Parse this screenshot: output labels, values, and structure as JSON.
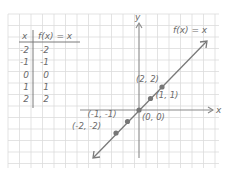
{
  "table": {
    "header": {
      "x": "x",
      "fx": "f(x) = x"
    },
    "rows": [
      {
        "x": "-2",
        "fx": "-2"
      },
      {
        "x": "-1",
        "fx": "-1"
      },
      {
        "x": "0",
        "fx": "0"
      },
      {
        "x": "1",
        "fx": "1"
      },
      {
        "x": "2",
        "fx": "2"
      }
    ]
  },
  "graph": {
    "x_axis_label": "x",
    "y_axis_label": "y",
    "function_label": "f(x) = x",
    "points": [
      {
        "label": "(-2, -2)",
        "x": -2,
        "y": -2
      },
      {
        "label": "(-1, -1)",
        "x": -1,
        "y": -1
      },
      {
        "label": "(0, 0)",
        "x": 0,
        "y": 0
      },
      {
        "label": "(1, 1)",
        "x": 1,
        "y": 1
      },
      {
        "label": "(2, 2)",
        "x": 2,
        "y": 2
      }
    ]
  },
  "colors": {
    "grid": "#dcdcdc",
    "axis": "#8a8a8a",
    "line": "#7a7a7a",
    "point": "#777777",
    "text": "#6b6b6b"
  }
}
